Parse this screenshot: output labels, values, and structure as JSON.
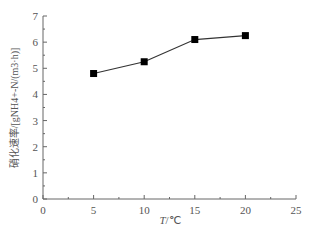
{
  "chart_data": {
    "type": "line",
    "title": "",
    "xlabel": "T/℃",
    "ylabel": "硝化速率/[gNH4+-N/(m3·h)]",
    "x": [
      5,
      10,
      15,
      20
    ],
    "series": [
      {
        "name": "硝化速率",
        "values": [
          4.8,
          5.25,
          6.1,
          6.25
        ],
        "marker": "square",
        "color": "#000000"
      }
    ],
    "xlim": [
      0,
      25
    ],
    "ylim": [
      0,
      7
    ],
    "xticks": [
      "0",
      "5",
      "10",
      "15",
      "20",
      "25"
    ],
    "yticks": [
      "0",
      "1",
      "2",
      "3",
      "4",
      "5",
      "6",
      "7"
    ],
    "grid": false,
    "legend": "none"
  },
  "labels": {
    "xlabel_italic": "T",
    "xlabel_unit": "/℃",
    "ylabel": "硝化速率/[gNH4+-N/(m3·h)]"
  }
}
